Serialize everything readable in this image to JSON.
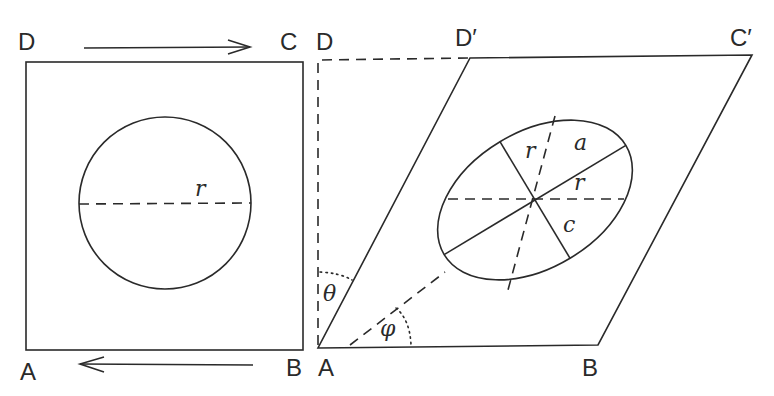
{
  "figure": {
    "colors": {
      "ink": "#2a2a2a",
      "background": "#ffffff"
    },
    "left_panel": {
      "corners": {
        "top_left": "D",
        "top_right": "C",
        "bottom_left": "A",
        "bottom_right": "B"
      },
      "circle_radius_label": "r",
      "top_arrow_direction": "right",
      "bottom_arrow_direction": "left"
    },
    "right_panel": {
      "corners": {
        "original_top_left": "D",
        "sheared_top_left": "D′",
        "sheared_top_right": "C′",
        "bottom_left": "A",
        "bottom_right": "B"
      },
      "ellipse_labels": {
        "r_upper": "r",
        "major_axis": "a",
        "r_horizontal": "r",
        "minor_axis": "c"
      },
      "angles": {
        "shear_angle": "θ",
        "orientation_angle": "φ"
      }
    }
  }
}
